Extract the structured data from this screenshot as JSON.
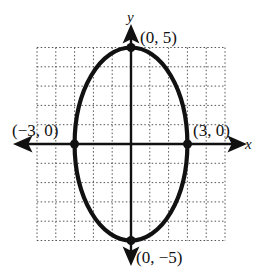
{
  "chart_data": {
    "type": "line",
    "title": "",
    "xlabel": "x",
    "ylabel": "y",
    "xlim": [
      -5,
      5
    ],
    "ylim": [
      -5,
      5
    ],
    "grid": true,
    "grid_style": "dotted",
    "curve": {
      "shape": "ellipse",
      "equation": "x^2/9 + y^2/25 = 1",
      "center": [
        0,
        0
      ],
      "semi_axis_x": 3,
      "semi_axis_y": 5
    },
    "points": [
      {
        "x": 0,
        "y": 5,
        "label": "(0, 5)"
      },
      {
        "x": 3,
        "y": 0,
        "label": "(3, 0)"
      },
      {
        "x": -3,
        "y": 0,
        "label": "(−3, 0)"
      },
      {
        "x": 0,
        "y": -5,
        "label": "(0, −5)"
      }
    ]
  },
  "labels": {
    "x_axis": "x",
    "y_axis": "y",
    "top": "(0, 5)",
    "right": "(3, 0)",
    "left": "(−3, 0)",
    "bottom": "(0, −5)"
  },
  "colors": {
    "ink": "#111111",
    "grid": "#555555",
    "background": "#ffffff"
  }
}
